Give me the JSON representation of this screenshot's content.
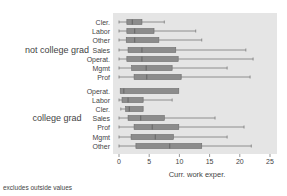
{
  "chart_data": {
    "type": "boxplot",
    "orientation": "horizontal",
    "title": "",
    "xlabel": "Curr. work exper.",
    "ylabel": "",
    "note": "excludes outside values",
    "xlim": [
      0,
      25
    ],
    "xticks": [
      0,
      5,
      10,
      15,
      20,
      25
    ],
    "grid": false,
    "legend": null,
    "groups": [
      {
        "name": "not college grad",
        "categories": [
          "Cler.",
          "Labor",
          "Other",
          "Sales",
          "Operat.",
          "Mgmt",
          "Prof"
        ],
        "boxes": [
          {
            "label": "Cler.",
            "whisker_low": 0.0,
            "q1": 1.3,
            "median": 2.2,
            "q3": 3.8,
            "whisker_high": 7.5
          },
          {
            "label": "Labor",
            "whisker_low": 0.0,
            "q1": 1.3,
            "median": 2.6,
            "q3": 5.8,
            "whisker_high": 12.7
          },
          {
            "label": "Other",
            "whisker_low": 0.0,
            "q1": 1.2,
            "median": 2.6,
            "q3": 6.6,
            "whisker_high": 13.7
          },
          {
            "label": "Sales",
            "whisker_low": 0.0,
            "q1": 1.5,
            "median": 3.8,
            "q3": 9.4,
            "whisker_high": 21.0
          },
          {
            "label": "Operat.",
            "whisker_low": 0.0,
            "q1": 1.3,
            "median": 3.8,
            "q3": 9.8,
            "whisker_high": 22.2
          },
          {
            "label": "Mgmt",
            "whisker_low": 0.0,
            "q1": 2.1,
            "median": 4.5,
            "q3": 8.8,
            "whisker_high": 17.9
          },
          {
            "label": "Prof",
            "whisker_low": 0.0,
            "q1": 2.5,
            "median": 4.6,
            "q3": 10.3,
            "whisker_high": 21.7
          }
        ]
      },
      {
        "name": "college grad",
        "categories": [
          "Operat.",
          "Labor",
          "Cler.",
          "Sales",
          "Prof",
          "Mgmt",
          "Other"
        ],
        "boxes": [
          {
            "label": "Operat.",
            "whisker_low": 0.2,
            "q1": 0.2,
            "median": 0.8,
            "q3": 9.9,
            "whisker_high": 9.9
          },
          {
            "label": "Labor",
            "whisker_low": 0.0,
            "q1": 0.5,
            "median": 1.5,
            "q3": 4.0,
            "whisker_high": 8.8
          },
          {
            "label": "Cler.",
            "whisker_low": 0.3,
            "q1": 1.1,
            "median": 1.7,
            "q3": 4.0,
            "whisker_high": 4.0
          },
          {
            "label": "Sales",
            "whisker_low": 0.0,
            "q1": 1.5,
            "median": 3.6,
            "q3": 7.5,
            "whisker_high": 15.9
          },
          {
            "label": "Prof",
            "whisker_low": 0.0,
            "q1": 2.5,
            "median": 5.5,
            "q3": 9.9,
            "whisker_high": 20.7
          },
          {
            "label": "Mgmt",
            "whisker_low": 0.0,
            "q1": 2.0,
            "median": 6.0,
            "q3": 9.0,
            "whisker_high": 17.9
          },
          {
            "label": "Other",
            "whisker_low": 0.0,
            "q1": 2.8,
            "median": 8.4,
            "q3": 13.7,
            "whisker_high": 21.9
          }
        ]
      }
    ]
  },
  "colors": {
    "plot_background": "#e5e5e5",
    "box_fill": "#8c8c8c",
    "box_stroke": "#6a6a6a",
    "whisker": "#7a7a7a",
    "text": "#444444"
  }
}
